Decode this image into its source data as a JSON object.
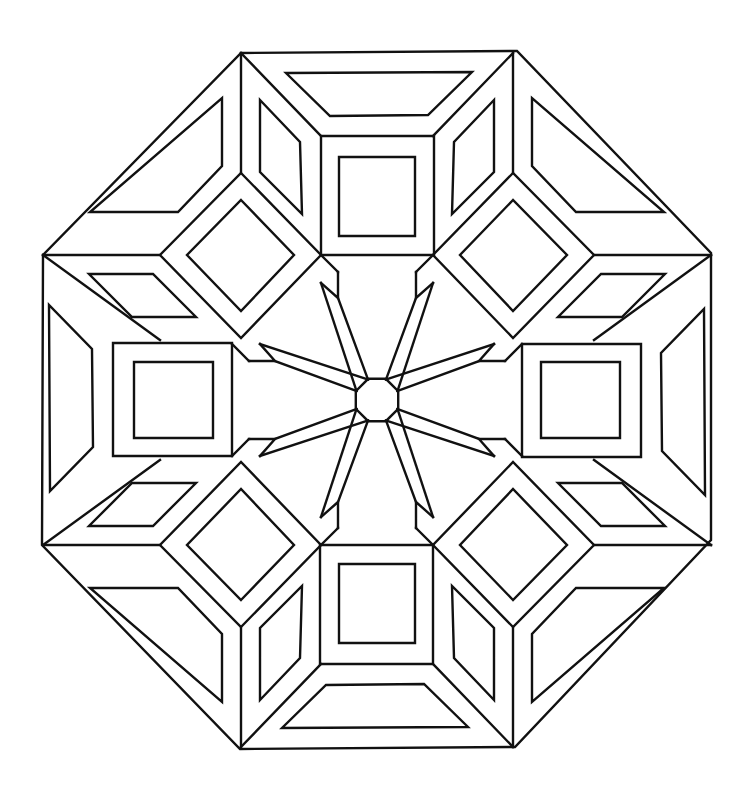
{
  "image": {
    "title": "Octagonal geometric mandala coloring page",
    "width": 736,
    "height": 797,
    "background": "#ffffff",
    "stroke_color": "#111111"
  },
  "geometry": {
    "center": [
      377,
      400
    ],
    "outer_octagon": [
      [
        241,
        53
      ],
      [
        517,
        51
      ],
      [
        711,
        253
      ],
      [
        711,
        540
      ],
      [
        515,
        747
      ],
      [
        240,
        749
      ],
      [
        42,
        545
      ],
      [
        43,
        255
      ]
    ],
    "quadrant_top_left": {
      "corner_lines": [
        [
          [
            241,
            53
          ],
          [
            241,
            173
          ]
        ],
        [
          [
            241,
            53
          ],
          [
            321,
            136
          ]
        ],
        [
          [
            43,
            255
          ],
          [
            160,
            255
          ]
        ],
        [
          [
            43,
            255
          ],
          [
            160,
            340
          ]
        ]
      ],
      "top_square_outer": [
        [
          321,
          136
        ],
        [
          434,
          136
        ],
        [
          434,
          255
        ],
        [
          321,
          255
        ]
      ],
      "top_square_inner": [
        [
          339,
          157
        ],
        [
          415,
          157
        ],
        [
          415,
          236
        ],
        [
          339,
          236
        ]
      ],
      "diamond_outer": [
        [
          241,
          173
        ],
        [
          321,
          255
        ],
        [
          241,
          338
        ],
        [
          160,
          255
        ]
      ],
      "diamond_inner": [
        [
          241,
          200
        ],
        [
          294,
          255
        ],
        [
          241,
          311
        ],
        [
          187,
          255
        ]
      ],
      "top_trapezoid_inner": [
        [
          286,
          73
        ],
        [
          472,
          72
        ],
        [
          428,
          115
        ],
        [
          330,
          116
        ]
      ],
      "upper_rhombus_inner": [
        [
          260,
          100
        ],
        [
          300,
          142
        ],
        [
          302,
          214
        ],
        [
          260,
          172
        ]
      ],
      "corner_triangle_inner": [
        [
          222,
          98
        ],
        [
          222,
          166
        ],
        [
          178,
          212
        ],
        [
          90,
          212
        ]
      ],
      "left_rhombus_inner": [
        [
          89,
          274
        ],
        [
          153,
          274
        ],
        [
          196,
          317
        ],
        [
          132,
          317
        ]
      ]
    },
    "center_octagon_radius": 23,
    "star": {
      "arms": 8,
      "inner_ring_square": [
        [
          321,
          255
        ],
        [
          434,
          255
        ],
        [
          434,
          545
        ],
        [
          321,
          545
        ]
      ]
    }
  }
}
